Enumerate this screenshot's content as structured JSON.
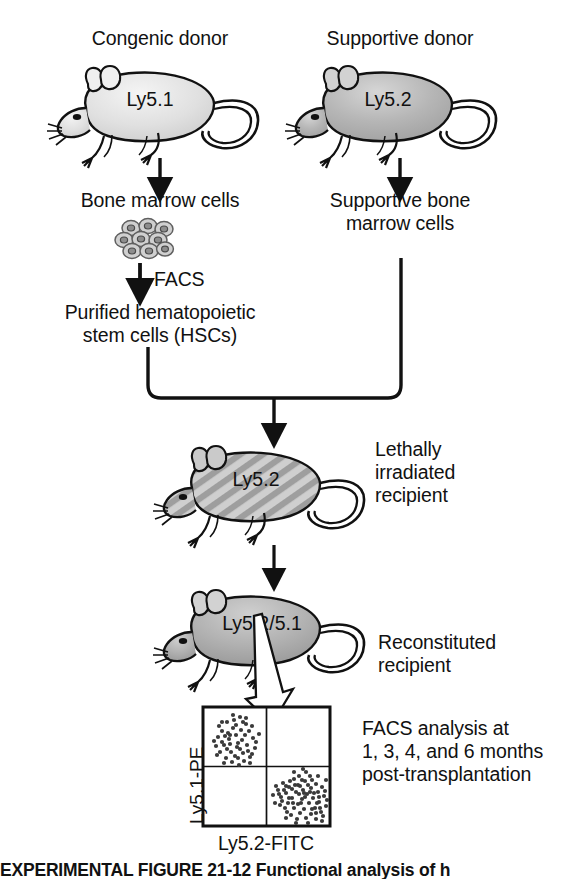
{
  "figure": {
    "donors": [
      {
        "header": "Congenic donor",
        "mouse_label": "Ly5.1",
        "mouse_shade": "light",
        "output_label": "Bone marrow cells",
        "process_label": "FACS",
        "product_label_line1": "Purified hematopoietic",
        "product_label_line2": "stem cells (HSCs)"
      },
      {
        "header": "Supportive donor",
        "mouse_label": "Ly5.2",
        "mouse_shade": "medium",
        "output_label_line1": "Supportive bone",
        "output_label_line2": "marrow cells"
      }
    ],
    "recipients": [
      {
        "mouse_label": "Ly5.2",
        "state": "irradiated",
        "annotation_line1": "Lethally",
        "annotation_line2": "irradiated",
        "annotation_line3": "recipient"
      },
      {
        "mouse_label": "Ly5.2/5.1",
        "state": "reconstituted",
        "annotation_line1": "Reconstituted",
        "annotation_line2": "recipient"
      }
    ],
    "facs_plot": {
      "y_axis_label": "Ly5.1-PE",
      "x_axis_label": "Ly5.2-FITC",
      "quadrants": [
        "upper-left",
        "upper-right",
        "lower-left",
        "lower-right"
      ],
      "populations": [
        {
          "quadrant": "upper-left",
          "marker": "Ly5.1-PE positive",
          "n_events": 52
        },
        {
          "quadrant": "lower-right",
          "marker": "Ly5.2-FITC positive",
          "n_events": 78
        }
      ]
    },
    "analysis_note": {
      "line1": "FACS analysis at",
      "line2": "1, 3, 4, and 6 months",
      "line3": "post-transplantation"
    },
    "caption": {
      "title": "EXPERIMENTAL FIGURE 21-12",
      "text": " Functional analysis of h"
    },
    "colors": {
      "ink": "#111111",
      "mouse_light": "#e3e3e3",
      "mouse_medium": "#b9b9b9",
      "mouse_dark": "#9a9a9a",
      "hatch": "#b5b5b5",
      "dot": "#3a3a3a"
    }
  }
}
